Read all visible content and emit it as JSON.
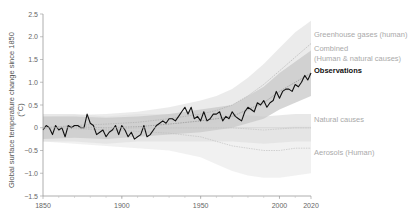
{
  "chart_data": {
    "type": "line",
    "title": "",
    "ylabel": "Global surface temperature change since 1850 (°C)",
    "ylabel_lines": [
      "Global surface temperature change since 1850",
      "(°C)"
    ],
    "xlabel": "",
    "xlim": [
      1850,
      2020
    ],
    "ylim": [
      -1.5,
      2.5
    ],
    "x_ticks": [
      1850,
      1900,
      1950,
      2000,
      2020
    ],
    "y_ticks": [
      2.5,
      2.0,
      1.5,
      1.0,
      0.5,
      0,
      -0.5,
      -1.0,
      -1.5
    ],
    "y_tick_labels": [
      "2.5",
      "2.0",
      "1.5",
      "1.0",
      "0.5",
      "0",
      "−0.5",
      "−1.0",
      "−1.5"
    ],
    "grid": false,
    "legend_placement": "right",
    "legend": [
      {
        "label": "Greenhouse gases (human)",
        "color": "#aaaaaa"
      },
      {
        "label": "Combined",
        "label2": "(Human & natural causes)",
        "color": "#999999"
      },
      {
        "label": "Observations",
        "color": "#111111"
      },
      {
        "label": "Natural causes",
        "color": "#bbbbbb"
      },
      {
        "label": "Aerosols (Human)",
        "color": "#bbbbbb"
      }
    ],
    "series": [
      {
        "name": "Observations",
        "color": "#111111",
        "x": [
          1850,
          1852,
          1854,
          1856,
          1858,
          1860,
          1862,
          1864,
          1866,
          1868,
          1870,
          1872,
          1874,
          1876,
          1878,
          1880,
          1882,
          1884,
          1886,
          1888,
          1890,
          1892,
          1894,
          1896,
          1898,
          1900,
          1902,
          1904,
          1906,
          1908,
          1910,
          1912,
          1914,
          1916,
          1918,
          1920,
          1922,
          1924,
          1926,
          1928,
          1930,
          1932,
          1934,
          1936,
          1938,
          1940,
          1942,
          1944,
          1946,
          1948,
          1950,
          1952,
          1954,
          1956,
          1958,
          1960,
          1962,
          1964,
          1966,
          1968,
          1970,
          1972,
          1974,
          1976,
          1978,
          1980,
          1982,
          1984,
          1986,
          1988,
          1990,
          1992,
          1994,
          1996,
          1998,
          2000,
          2002,
          2004,
          2006,
          2008,
          2010,
          2012,
          2014,
          2016,
          2018,
          2020
        ],
        "values": [
          -0.05,
          0.05,
          0.0,
          -0.15,
          0.05,
          -0.05,
          0.0,
          -0.2,
          0.05,
          0.0,
          0.05,
          0.05,
          0.0,
          0.0,
          0.3,
          0.1,
          0.05,
          -0.15,
          -0.1,
          -0.05,
          -0.2,
          -0.1,
          -0.05,
          0.05,
          -0.15,
          0.05,
          -0.05,
          -0.2,
          -0.1,
          -0.25,
          -0.2,
          -0.15,
          0.05,
          -0.2,
          -0.15,
          -0.05,
          0.05,
          0.1,
          0.15,
          0.1,
          0.2,
          0.2,
          0.15,
          0.25,
          0.35,
          0.45,
          0.3,
          0.45,
          0.2,
          0.25,
          0.15,
          0.35,
          0.15,
          0.2,
          0.3,
          0.3,
          0.35,
          0.15,
          0.25,
          0.2,
          0.35,
          0.25,
          0.2,
          0.15,
          0.35,
          0.45,
          0.4,
          0.35,
          0.55,
          0.5,
          0.6,
          0.45,
          0.55,
          0.6,
          0.8,
          0.65,
          0.8,
          0.85,
          0.85,
          0.8,
          0.95,
          0.9,
          1.0,
          1.15,
          1.05,
          1.2
        ]
      },
      {
        "name": "Combined (Human & natural causes)",
        "color": "#888888",
        "x": [
          1850,
          1870,
          1890,
          1910,
          1930,
          1950,
          1960,
          1970,
          1980,
          1990,
          2000,
          2010,
          2020
        ],
        "values": [
          0.0,
          0.02,
          0.0,
          0.02,
          0.08,
          0.15,
          0.2,
          0.25,
          0.4,
          0.55,
          0.8,
          1.0,
          1.2
        ],
        "band_low": [
          -0.25,
          -0.22,
          -0.25,
          -0.2,
          -0.15,
          -0.1,
          -0.05,
          0.0,
          0.1,
          0.2,
          0.4,
          0.55,
          0.7
        ],
        "band_high": [
          0.25,
          0.25,
          0.22,
          0.25,
          0.3,
          0.4,
          0.45,
          0.5,
          0.7,
          0.9,
          1.2,
          1.45,
          1.7
        ]
      },
      {
        "name": "Greenhouse gases (human)",
        "color": "#aaaaaa",
        "x": [
          1850,
          1870,
          1890,
          1910,
          1930,
          1950,
          1960,
          1970,
          1980,
          1990,
          2000,
          2010,
          2020
        ],
        "values": [
          0.0,
          0.05,
          0.08,
          0.12,
          0.2,
          0.3,
          0.38,
          0.5,
          0.7,
          0.95,
          1.25,
          1.55,
          1.85
        ],
        "band_low": [
          -0.2,
          -0.15,
          -0.12,
          -0.08,
          0.0,
          0.05,
          0.1,
          0.2,
          0.35,
          0.5,
          0.7,
          0.9,
          1.1
        ],
        "band_high": [
          0.25,
          0.28,
          0.3,
          0.35,
          0.45,
          0.6,
          0.7,
          0.85,
          1.1,
          1.4,
          1.75,
          2.1,
          2.35
        ]
      },
      {
        "name": "Natural causes",
        "color": "#bbbbbb",
        "x": [
          1850,
          1870,
          1890,
          1910,
          1930,
          1950,
          1970,
          1990,
          2010,
          2020
        ],
        "values": [
          0.0,
          0.0,
          -0.05,
          0.0,
          0.0,
          0.0,
          0.0,
          -0.05,
          0.0,
          0.0
        ],
        "band_low": [
          -0.3,
          -0.3,
          -0.35,
          -0.3,
          -0.3,
          -0.3,
          -0.3,
          -0.35,
          -0.3,
          -0.3
        ],
        "band_high": [
          0.3,
          0.3,
          0.25,
          0.3,
          0.3,
          0.3,
          0.3,
          0.25,
          0.3,
          0.3
        ]
      },
      {
        "name": "Aerosols (Human)",
        "color": "#bbbbbb",
        "x": [
          1850,
          1870,
          1890,
          1910,
          1930,
          1950,
          1960,
          1970,
          1980,
          1990,
          2000,
          2010,
          2020
        ],
        "values": [
          0.0,
          -0.02,
          -0.05,
          -0.08,
          -0.12,
          -0.2,
          -0.3,
          -0.4,
          -0.45,
          -0.5,
          -0.5,
          -0.45,
          -0.45
        ],
        "band_low": [
          -0.3,
          -0.35,
          -0.4,
          -0.45,
          -0.5,
          -0.65,
          -0.8,
          -0.95,
          -1.05,
          -1.1,
          -1.1,
          -1.05,
          -1.0
        ],
        "band_high": [
          0.25,
          0.25,
          0.2,
          0.2,
          0.15,
          0.1,
          0.05,
          0.0,
          0.0,
          -0.05,
          0.0,
          0.05,
          0.05
        ]
      }
    ]
  }
}
